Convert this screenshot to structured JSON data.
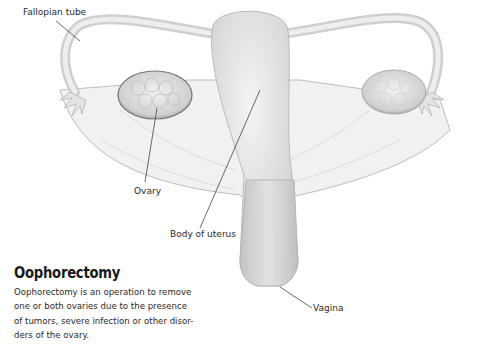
{
  "labels": {
    "fallopian_tube": "Fallopian tube",
    "ovary": "Ovary",
    "body_of_uterus": "Body of uterus",
    "vagina": "Vagina"
  },
  "caption": {
    "title": "Oophorectomy",
    "lines": [
      "Oophorectomy is an operation to remove",
      "one or both ovaries due to the presence",
      "of tumors, severe infection or other disor-",
      "ders of the ovary."
    ]
  }
}
